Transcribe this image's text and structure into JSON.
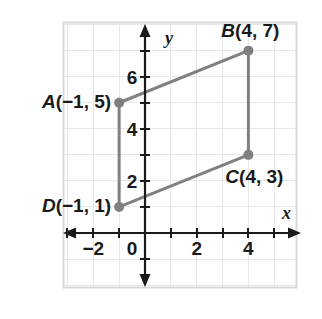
{
  "chart_data": {
    "type": "scatter",
    "title": "",
    "xlabel": "x",
    "ylabel": "y",
    "xlim": [
      -3,
      6
    ],
    "ylim": [
      -2,
      8
    ],
    "grid": true,
    "legend": false,
    "x_ticks": [
      -3,
      -2,
      -1,
      0,
      1,
      2,
      3,
      4,
      5
    ],
    "y_ticks": [
      -1,
      1,
      2,
      3,
      4,
      5,
      6,
      7
    ],
    "x_tick_labels": [
      {
        "value": -2,
        "text": "−2"
      },
      {
        "value": 0,
        "text": "0"
      },
      {
        "value": 2,
        "text": "2"
      },
      {
        "value": 4,
        "text": "4"
      }
    ],
    "y_tick_labels": [
      {
        "value": 2,
        "text": "2"
      },
      {
        "value": 4,
        "text": "4"
      },
      {
        "value": 6,
        "text": "6"
      }
    ],
    "shape": "quadrilateral ABCD",
    "points": [
      {
        "name": "A",
        "x": -1,
        "y": 5,
        "label": "A(−1, 5)"
      },
      {
        "name": "B",
        "x": 4,
        "y": 7,
        "label": "B(4, 7)"
      },
      {
        "name": "C",
        "x": 4,
        "y": 3,
        "label": "C(4, 3)"
      },
      {
        "name": "D",
        "x": -1,
        "y": 1,
        "label": "D(−1, 1)"
      }
    ],
    "edges": [
      [
        "A",
        "B"
      ],
      [
        "B",
        "C"
      ],
      [
        "C",
        "D"
      ],
      [
        "D",
        "A"
      ]
    ],
    "colors": {
      "shape_stroke": "#808080",
      "point_fill": "#808080",
      "axis": "#1a1a1a",
      "grid": "#e6e6e6",
      "frame": "#d9d9d9",
      "text": "#1a1a1a",
      "background": "#ffffff"
    }
  },
  "axis_labels": {
    "x": "x",
    "y": "y"
  },
  "origin_label": "0"
}
